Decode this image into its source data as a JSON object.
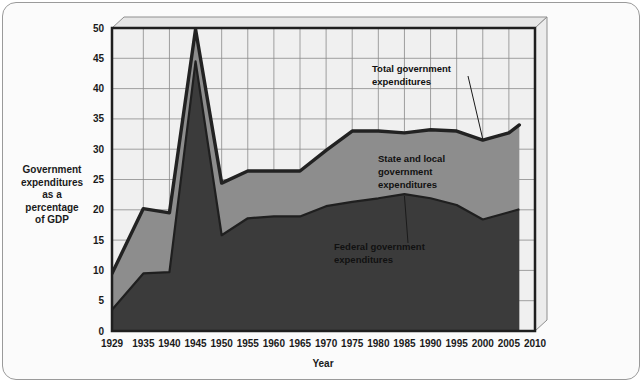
{
  "chart_data": {
    "type": "area",
    "title": "",
    "xlabel": "Year",
    "ylabel": "Government expenditures as a percentage of GDP",
    "ylabel_lines": [
      "Government",
      "expenditures",
      "as a",
      "percentage",
      "of GDP"
    ],
    "xlim": [
      1929,
      2010
    ],
    "ylim": [
      0,
      50
    ],
    "yticks": [
      0,
      5,
      10,
      15,
      20,
      25,
      30,
      35,
      40,
      45,
      50
    ],
    "xticks": [
      1929,
      1935,
      1940,
      1945,
      1950,
      1955,
      1960,
      1965,
      1970,
      1975,
      1980,
      1985,
      1990,
      1995,
      2000,
      2005,
      2010
    ],
    "grid": true,
    "legend_position": "inline-annotations",
    "stacked": true,
    "x": [
      1929,
      1935,
      1940,
      1945,
      1950,
      1955,
      1960,
      1965,
      1970,
      1975,
      1980,
      1985,
      1990,
      1995,
      2000,
      2005,
      2007
    ],
    "series": [
      {
        "name": "Federal government expenditures",
        "color": "#3b3b3b",
        "values": [
          3.5,
          9.5,
          9.7,
          44.5,
          15.8,
          18.6,
          18.9,
          18.9,
          20.6,
          21.3,
          21.9,
          22.6,
          21.9,
          20.8,
          18.4,
          19.6,
          20.1
        ]
      },
      {
        "name": "State and local government expenditures",
        "color": "#8d8d8d",
        "values": [
          6.0,
          10.7,
          9.8,
          5.3,
          8.6,
          7.8,
          7.5,
          7.5,
          9.2,
          11.7,
          11.1,
          10.1,
          11.3,
          12.2,
          13.1,
          13.1,
          13.9
        ]
      }
    ],
    "total_series": {
      "name": "Total government expenditures",
      "color": "#222222",
      "values": [
        9.5,
        20.2,
        19.5,
        49.8,
        24.4,
        26.4,
        26.4,
        26.4,
        29.8,
        33.0,
        33.0,
        32.7,
        33.2,
        33.0,
        31.5,
        32.7,
        34.0
      ]
    },
    "annotations": [
      {
        "label_lines": [
          "Total government",
          "expenditures"
        ],
        "target_x": 2000,
        "target_y": 31.5
      },
      {
        "label_lines": [
          "State and local",
          "government",
          "expenditures"
        ],
        "target_x": null,
        "target_y": null
      },
      {
        "label_lines": [
          "Federal government",
          "expenditures"
        ],
        "target_x": 1985,
        "target_y": 22.6
      }
    ]
  },
  "colors": {
    "federal_fill": "#3b3b3b",
    "state_local_fill": "#8d8d8d",
    "plot_background": "#f0f0f0",
    "total_line": "#1f1f1f",
    "grid": "#8a8a8a",
    "panel_background": "#fbfbfb",
    "panel_border": "#9a9a9a",
    "text": "#1a1a1a"
  }
}
